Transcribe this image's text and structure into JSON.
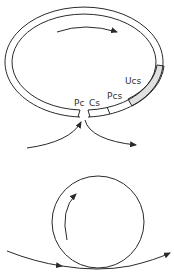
{
  "diagram": {
    "top_ring": {
      "labels": {
        "pc": "Pc",
        "cs": "Cs",
        "pcs": "Pcs",
        "ucs": "Ucs"
      },
      "shaded_segment_color": "#e0e0e0",
      "circulation_arrow": "clockwise"
    },
    "bottom_circle": {
      "circulation_arrow": "clockwise"
    },
    "colors": {
      "line": "#2a2a2a",
      "background": "#ffffff"
    }
  }
}
